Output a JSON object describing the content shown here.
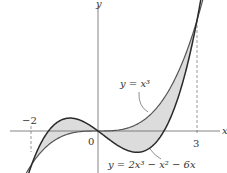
{
  "figure": {
    "axes": {
      "x_label": "x",
      "y_label": "y",
      "origin_label": "0",
      "ticks": [
        {
          "value": -2,
          "label": "−2"
        },
        {
          "value": 3,
          "label": "3"
        }
      ]
    },
    "curves": [
      {
        "name": "cubic",
        "label": "y = x³",
        "expression": "x^3"
      },
      {
        "name": "polynomial",
        "label": "y = 2x³ − x² − 6x",
        "expression": "2x^3 - x^2 - 6x"
      }
    ],
    "intersections_x": [
      -2,
      0,
      3
    ],
    "shaded_region": "area between y = x³ and y = 2x³ − x² − 6x from x = −2 to x = 3",
    "colors": {
      "curve_dark": "#2a2a2a",
      "curve_light": "#555555",
      "fill": "#dcdcdc",
      "axis": "#666666"
    }
  }
}
